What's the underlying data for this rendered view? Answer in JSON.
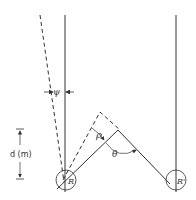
{
  "diagram": {
    "labels": {
      "psi": "ψ",
      "rho": "ρ",
      "theta": "θ",
      "distance": "d (m)",
      "receiver_left": "R",
      "receiver_right": "R'"
    },
    "colors": {
      "line": "#333333",
      "background": "#ffffff"
    }
  }
}
